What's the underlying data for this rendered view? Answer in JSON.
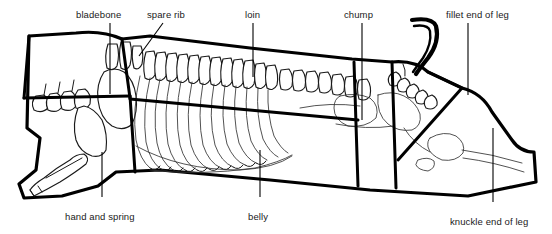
{
  "figure": {
    "background_color": "#ffffff",
    "line_color": "#000000",
    "label_color": "#1a1a1a"
  },
  "labels": [
    {
      "id": "bladebone",
      "text": "bladebone",
      "text_x": 76,
      "text_y": 18,
      "anchor": "start",
      "leader": "M 110 23 L 110 94"
    },
    {
      "id": "spare-rib",
      "text": "spare rib",
      "text_x": 147,
      "text_y": 18,
      "anchor": "start",
      "leader": "M 163 23 L 139 56"
    },
    {
      "id": "loin",
      "text": "loin",
      "text_x": 245,
      "text_y": 18,
      "anchor": "start",
      "leader": "M 253 23 L 253 77"
    },
    {
      "id": "chump",
      "text": "chump",
      "text_x": 344,
      "text_y": 18,
      "anchor": "start",
      "leader": "M 362 23 L 362 120"
    },
    {
      "id": "fillet-end-of-leg",
      "text": "fillet end of leg",
      "text_x": 446,
      "text_y": 18,
      "anchor": "start",
      "leader": "M 468 23 L 468 95"
    },
    {
      "id": "hand-and-spring",
      "text": "hand and spring",
      "text_x": 65,
      "text_y": 220,
      "anchor": "start",
      "leader": "M 102 197 L 102 152"
    },
    {
      "id": "belly",
      "text": "belly",
      "text_x": 248,
      "text_y": 220,
      "anchor": "start",
      "leader": "M 260 197 L 260 150"
    },
    {
      "id": "knuckle-end-of-leg",
      "text": "knuckle end of leg",
      "text_x": 450,
      "text_y": 225,
      "anchor": "start",
      "leader": "M 493 202 L 493 128"
    }
  ],
  "cuts": [
    "bladebone",
    "spare rib",
    "loin",
    "chump",
    "fillet end of leg",
    "hand and spring",
    "belly",
    "knuckle end of leg"
  ]
}
